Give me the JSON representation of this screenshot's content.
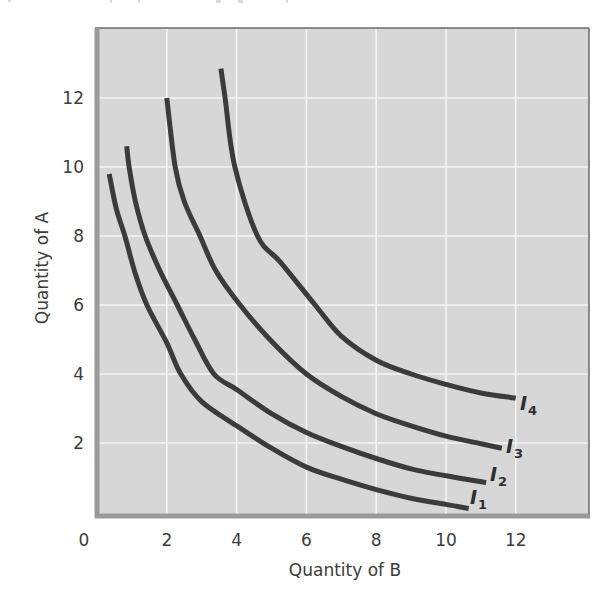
{
  "chart_data": {
    "type": "line",
    "title": "",
    "xlabel": "Quantity of B",
    "ylabel": "Quantity of A",
    "xlim": [
      0,
      14.2
    ],
    "ylim": [
      0,
      14.1
    ],
    "x_ticks": [
      "0",
      "2",
      "4",
      "6",
      "8",
      "10",
      "12"
    ],
    "x_tick_values": [
      0,
      2,
      4,
      6,
      8,
      10,
      12
    ],
    "y_ticks": [
      "2",
      "4",
      "6",
      "8",
      "10",
      "12"
    ],
    "y_tick_values": [
      2,
      4,
      6,
      8,
      10,
      12
    ],
    "grid": true,
    "legend": "none (curves labeled inline at right end)",
    "series": [
      {
        "name": "I1",
        "label_main": "I",
        "label_sub": "1",
        "points": [
          [
            0.35,
            9.8
          ],
          [
            0.55,
            8.8
          ],
          [
            0.8,
            8
          ],
          [
            1.1,
            6.9
          ],
          [
            1.43,
            6
          ],
          [
            2,
            4.9
          ],
          [
            2.4,
            4
          ],
          [
            3,
            3.2
          ],
          [
            4,
            2.5
          ],
          [
            5,
            1.85
          ],
          [
            6,
            1.3
          ],
          [
            7,
            0.95
          ],
          [
            8,
            0.65
          ],
          [
            9,
            0.4
          ],
          [
            10,
            0.22
          ],
          [
            10.65,
            0.1
          ]
        ]
      },
      {
        "name": "I2",
        "label_main": "I",
        "label_sub": "2",
        "points": [
          [
            0.85,
            10.6
          ],
          [
            0.92,
            10
          ],
          [
            1.1,
            9
          ],
          [
            1.38,
            8
          ],
          [
            1.8,
            7
          ],
          [
            2.3,
            6
          ],
          [
            2.8,
            5
          ],
          [
            3.35,
            4
          ],
          [
            4,
            3.55
          ],
          [
            5,
            2.85
          ],
          [
            6,
            2.3
          ],
          [
            7,
            1.9
          ],
          [
            8,
            1.55
          ],
          [
            9,
            1.25
          ],
          [
            10,
            1.05
          ],
          [
            11.15,
            0.85
          ]
        ]
      },
      {
        "name": "I3",
        "label_main": "I",
        "label_sub": "3",
        "points": [
          [
            2,
            12
          ],
          [
            2.24,
            10
          ],
          [
            2.5,
            9
          ],
          [
            2.95,
            8
          ],
          [
            3.4,
            7
          ],
          [
            4.1,
            6
          ],
          [
            5,
            4.95
          ],
          [
            6,
            4
          ],
          [
            7,
            3.35
          ],
          [
            8,
            2.85
          ],
          [
            9,
            2.5
          ],
          [
            10,
            2.2
          ],
          [
            11,
            1.98
          ],
          [
            11.6,
            1.85
          ]
        ]
      },
      {
        "name": "I4",
        "label_main": "I",
        "label_sub": "4",
        "points": [
          [
            3.55,
            12.85
          ],
          [
            3.67,
            12
          ],
          [
            3.95,
            10
          ],
          [
            4.6,
            8
          ],
          [
            5.25,
            7.25
          ],
          [
            6.25,
            6
          ],
          [
            7,
            5.1
          ],
          [
            8,
            4.4
          ],
          [
            9,
            4
          ],
          [
            10,
            3.7
          ],
          [
            11,
            3.45
          ],
          [
            12,
            3.3
          ]
        ]
      }
    ]
  },
  "colors": {
    "plot_background": "#d7d7d7",
    "grid": "#f4f4f4",
    "curve": "#3b3b3b",
    "axis_frame": "#9a9a9a",
    "frame_dark": "#6a6a6a",
    "text": "#3c3c3c"
  }
}
